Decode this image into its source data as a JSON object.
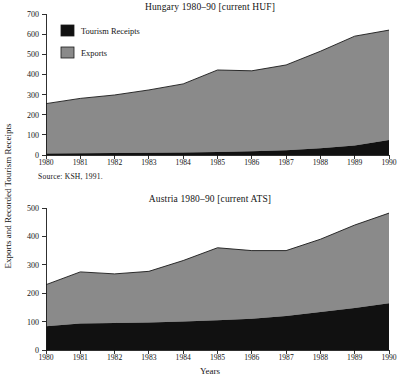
{
  "figure": {
    "y_axis_title": "Exports and Recorded Tourism Receipts",
    "x_axis_title": "Years"
  },
  "legend": {
    "position": "upper-left-inside-top-chart",
    "entries": [
      {
        "label": "Tourism Receipts",
        "color": "#111111"
      },
      {
        "label": "Exports",
        "color": "#8a8a8a"
      }
    ]
  },
  "colors": {
    "tourism_receipts": "#111111",
    "exports": "#8a8a8a",
    "axis": "#1a1a1a",
    "background": "#ffffff"
  },
  "notes": {
    "hungary_source": "Source:  KSH, 1991.",
    "austria_source": ""
  },
  "chart_data": [
    {
      "type": "area",
      "stacked": true,
      "title": "Hungary 1980–90 [current HUF]",
      "xlabel": "",
      "ylabel": "Exports and Recorded Tourism Receipts",
      "x": [
        1980,
        1981,
        1982,
        1983,
        1984,
        1985,
        1986,
        1987,
        1988,
        1989,
        1990
      ],
      "categories": [
        "1980",
        "1981",
        "1982",
        "1983",
        "1984",
        "1985",
        "1986",
        "1987",
        "1988",
        "1989",
        "1990"
      ],
      "xlim": [
        1980,
        1990
      ],
      "ylim": [
        0,
        700
      ],
      "yticks": [
        0,
        100,
        200,
        300,
        400,
        500,
        600,
        700
      ],
      "grid": false,
      "legend_position": "upper left",
      "series": [
        {
          "name": "Tourism Receipts",
          "color": "#111111",
          "values": [
            8,
            9,
            10,
            11,
            13,
            15,
            18,
            24,
            33,
            47,
            75
          ]
        },
        {
          "name": "Exports",
          "color": "#8a8a8a",
          "values": [
            247,
            272,
            288,
            312,
            340,
            407,
            400,
            423,
            482,
            543,
            545
          ]
        }
      ],
      "totals": [
        255,
        281,
        298,
        323,
        353,
        422,
        418,
        447,
        515,
        590,
        620
      ],
      "source": "Source:  KSH, 1991."
    },
    {
      "type": "area",
      "stacked": true,
      "title": "Austria 1980–90 [current ATS]",
      "xlabel": "Years",
      "ylabel": "Exports and Recorded Tourism Receipts",
      "x": [
        1980,
        1981,
        1982,
        1983,
        1984,
        1985,
        1986,
        1987,
        1988,
        1989,
        1990
      ],
      "categories": [
        "1980",
        "1981",
        "1982",
        "1983",
        "1984",
        "1985",
        "1986",
        "1987",
        "1988",
        "1989",
        "1990"
      ],
      "xlim": [
        1980,
        1990
      ],
      "ylim": [
        0,
        500
      ],
      "yticks": [
        0,
        100,
        200,
        300,
        400,
        500
      ],
      "grid": false,
      "legend_position": "none",
      "series": [
        {
          "name": "Tourism Receipts",
          "color": "#111111",
          "values": [
            84,
            93,
            95,
            97,
            100,
            105,
            110,
            120,
            134,
            148,
            165
          ]
        },
        {
          "name": "Exports",
          "color": "#8a8a8a",
          "values": [
            146,
            182,
            173,
            180,
            215,
            255,
            240,
            230,
            256,
            292,
            317
          ]
        }
      ],
      "totals": [
        230,
        275,
        268,
        277,
        315,
        360,
        350,
        350,
        390,
        440,
        482
      ],
      "source": ""
    }
  ]
}
